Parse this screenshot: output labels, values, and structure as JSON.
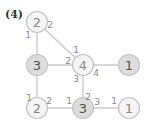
{
  "problem_label": "(4)",
  "colors": {
    "edge": "#c8c8c8",
    "node_stroke": "#c4c4c4",
    "node_fill_light": "#f4f4f4",
    "node_fill_shaded": "#dcdcdc",
    "node_text": "#555555",
    "node_text_light": "#8a8a8a",
    "edge_label": "#8a8a8a"
  },
  "nodes": [
    {
      "id": "a",
      "value": "2",
      "x": 37,
      "y": 22,
      "shaded": false
    },
    {
      "id": "b",
      "value": "3",
      "x": 37,
      "y": 65,
      "shaded": true
    },
    {
      "id": "c",
      "value": "4",
      "x": 83,
      "y": 65,
      "shaded": false
    },
    {
      "id": "d",
      "value": "1",
      "x": 129,
      "y": 65,
      "shaded": true
    },
    {
      "id": "e",
      "value": "2",
      "x": 37,
      "y": 108,
      "shaded": false
    },
    {
      "id": "f",
      "value": "3",
      "x": 83,
      "y": 108,
      "shaded": true
    },
    {
      "id": "g",
      "value": "1",
      "x": 129,
      "y": 108,
      "shaded": false
    }
  ],
  "edges": [
    {
      "from": "a",
      "to": "b"
    },
    {
      "from": "a",
      "to": "c"
    },
    {
      "from": "b",
      "to": "c"
    },
    {
      "from": "c",
      "to": "d"
    },
    {
      "from": "b",
      "to": "e"
    },
    {
      "from": "c",
      "to": "f"
    },
    {
      "from": "e",
      "to": "f"
    },
    {
      "from": "f",
      "to": "g"
    }
  ],
  "edge_labels": [
    {
      "text": "1",
      "x": 28,
      "y": 35
    },
    {
      "text": "2",
      "x": 50,
      "y": 25
    },
    {
      "text": "1",
      "x": 76,
      "y": 50
    },
    {
      "text": "2",
      "x": 68,
      "y": 61
    },
    {
      "text": "4",
      "x": 96,
      "y": 73
    },
    {
      "text": "3",
      "x": 76,
      "y": 79
    },
    {
      "text": "1",
      "x": 29,
      "y": 98
    },
    {
      "text": "2",
      "x": 49,
      "y": 101
    },
    {
      "text": "1",
      "x": 69,
      "y": 101
    },
    {
      "text": "2",
      "x": 88,
      "y": 97
    },
    {
      "text": "3",
      "x": 97,
      "y": 102
    },
    {
      "text": "1",
      "x": 114,
      "y": 101
    }
  ]
}
